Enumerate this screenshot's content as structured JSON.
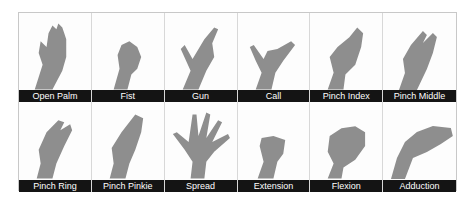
{
  "figure": {
    "gestures": [
      {
        "label": "Open Palm",
        "icon": "open-palm-icon"
      },
      {
        "label": "Fist",
        "icon": "fist-icon"
      },
      {
        "label": "Gun",
        "icon": "gun-hand-icon"
      },
      {
        "label": "Call",
        "icon": "call-hand-icon"
      },
      {
        "label": "Pinch Index",
        "icon": "pinch-index-icon"
      },
      {
        "label": "Pinch Middle",
        "icon": "pinch-middle-icon"
      },
      {
        "label": "Pinch Ring",
        "icon": "pinch-ring-icon"
      },
      {
        "label": "Pinch Pinkie",
        "icon": "pinch-pinkie-icon"
      },
      {
        "label": "Spread",
        "icon": "spread-hand-icon"
      },
      {
        "label": "Extension",
        "icon": "wrist-extension-icon"
      },
      {
        "label": "Flexion",
        "icon": "wrist-flexion-icon"
      },
      {
        "label": "Adduction",
        "icon": "wrist-adduction-icon"
      }
    ],
    "colors": {
      "label_bg": "#141414",
      "label_text": "#ffffff",
      "skin": "#8e8e8e"
    }
  }
}
